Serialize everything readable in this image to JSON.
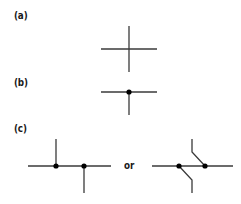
{
  "colors": {
    "line": "#3a3a3a",
    "dot": "#000000",
    "text": "#1a1a1a",
    "background": "#ffffff"
  },
  "panels": [
    {
      "id": "a",
      "label": "(a)",
      "description": "four-way crossing without junction dot"
    },
    {
      "id": "b",
      "label": "(b)",
      "description": "T-junction with junction dot"
    },
    {
      "id": "c",
      "label": "(c)",
      "description": "four-way connection drawn as two offset T-junctions, or jogged variant"
    }
  ],
  "separator": {
    "text": "or"
  }
}
